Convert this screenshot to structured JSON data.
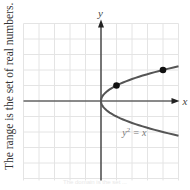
{
  "caption": {
    "side": "The range is the set of real numbers.",
    "bottom": "The domain is the set ..."
  },
  "colors": {
    "grid": "#e4e4e4",
    "axis": "#222222",
    "curve": "#555555",
    "point": "#111111",
    "label": "#444444"
  },
  "chart_data": {
    "type": "line",
    "title": "",
    "equation_label": "y² = x",
    "xlabel": "x",
    "ylabel": "y",
    "xlim": [
      -5,
      5
    ],
    "ylim": [
      -5,
      5
    ],
    "grid": true,
    "legend": "none",
    "series": [
      {
        "name": "y^2 = x",
        "description": "sideways parabola opening right, vertex at origin",
        "x": [
          0,
          0.25,
          1,
          2.25,
          4,
          5,
          0.25,
          1,
          2.25,
          4,
          5
        ],
        "y": [
          0,
          0.5,
          1,
          1.5,
          2,
          2.24,
          -0.5,
          -1,
          -1.5,
          -2,
          -2.24
        ]
      }
    ],
    "highlighted_points": [
      {
        "x": 1,
        "y": 1
      },
      {
        "x": 4,
        "y": 2
      }
    ],
    "annotations": [
      {
        "text": "y² = x",
        "x": 1.5,
        "y": -2.1
      }
    ]
  },
  "labels": {
    "x_axis": "x",
    "y_axis": "y",
    "eq_base": "y",
    "eq_sup": "2",
    "eq_rest": " = x"
  }
}
